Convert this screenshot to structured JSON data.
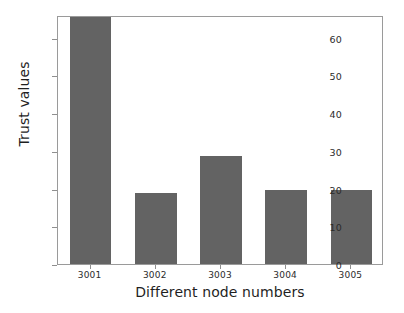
{
  "chart_data": {
    "type": "bar",
    "title": "",
    "xlabel": "Different node numbers",
    "ylabel": "Trust values",
    "categories": [
      "3001",
      "3002",
      "3003",
      "3004",
      "3005"
    ],
    "values": [
      65.5,
      18.8,
      28.5,
      19.7,
      19.6
    ],
    "ylim": [
      0,
      66
    ],
    "yticks": [
      0,
      10,
      20,
      30,
      40,
      50,
      60
    ],
    "ytick_labels": [
      "0",
      "10",
      "20",
      "30",
      "40",
      "50",
      "60"
    ],
    "grid": false,
    "legend": null,
    "bar_color": "#636363",
    "axis_color": "#9a9a9a",
    "background": "#ffffff"
  }
}
